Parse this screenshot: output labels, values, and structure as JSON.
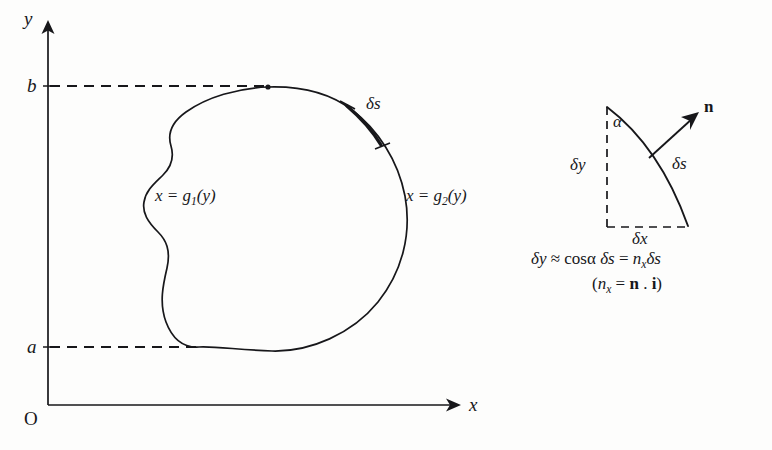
{
  "figure": {
    "kind": "mathematical-diagram",
    "background_color": "#fdfdfc",
    "ink_color": "#17171a"
  },
  "axes": {
    "y_axis_label": "y",
    "x_axis_label": "x",
    "origin_label": "O",
    "y_tick_upper_label": "b",
    "y_tick_lower_label": "a"
  },
  "region": {
    "left_boundary_label_prefix": "x = g",
    "left_boundary_subscript": "1",
    "left_boundary_label_suffix": "(y)",
    "right_boundary_label_prefix": "x = g",
    "right_boundary_subscript": "2",
    "right_boundary_label_suffix": "(y)",
    "arc_element_label": "δs"
  },
  "inset": {
    "delta_y_label": "δy",
    "delta_x_label": "δx",
    "delta_s_label": "δs",
    "alpha_label": "α",
    "normal_label": "n",
    "equation": {
      "lhs": "δy",
      "approx_sign": "≈",
      "cos_term": "cosα",
      "ds_term": "δs",
      "equals_sign": "=",
      "n_symbol": "n",
      "n_subscript": "x",
      "ds_term_2": "δs"
    },
    "note": {
      "open_paren": "(",
      "n_symbol": "n",
      "n_subscript": "x",
      "equals_sign": "=",
      "vector_n": "n",
      "dot": ".",
      "vector_i": "i",
      "close_paren": ")"
    }
  }
}
